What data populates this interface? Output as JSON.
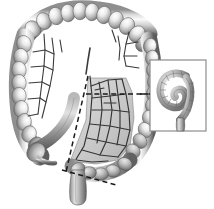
{
  "figure": {
    "style": "grayscale medical illustration",
    "background_color": "#ffffff",
    "width": 214,
    "height": 209
  },
  "palette": {
    "outline": "#2f2f2f",
    "bowel_light": "#f2f2f2",
    "bowel_mid": "#b8b8b8",
    "bowel_dark": "#6e6e6e",
    "bowel_shadow": "#4a4a4a",
    "mesentery_fill": "#c9c9c9",
    "mesentery_fill_light": "#d8d8d8",
    "vessel": "#3a3a3a",
    "dash_line": "#1a1a1a",
    "inset_border": "#8c8c8c",
    "inset_background": "#ffffff"
  },
  "structures": {
    "transverse_colon": {
      "name": "Transverse colon",
      "haustra_count": 11,
      "location": "top"
    },
    "ascending_colon": {
      "name": "Ascending colon",
      "haustra_count": 9,
      "location": "left"
    },
    "descending_colon": {
      "name": "Descending colon",
      "haustra_count": 10,
      "location": "right"
    },
    "hepatic_flexure": {
      "name": "Hepatic flexure",
      "location": "upper-left"
    },
    "splenic_flexure": {
      "name": "Splenic flexure",
      "location": "upper-right"
    },
    "cecum": {
      "name": "Cecum",
      "location": "lower-left"
    },
    "terminal_ileum": {
      "name": "Terminal ileum",
      "location": "lower-left-center"
    },
    "appendix": {
      "name": "Appendix",
      "location": "lower-left"
    },
    "sigmoid_colon": {
      "name": "Sigmoid colon",
      "location": "bottom-center"
    },
    "rectum": {
      "name": "Rectum",
      "location": "bottom-center"
    },
    "mesentery": {
      "name": "Mesentery with vascular arcade",
      "shaded": true,
      "location": "center-right"
    }
  },
  "resection": {
    "proximal_cut_line": {
      "name": "Proximal resection line",
      "style": "dashed",
      "orientation": "horizontal",
      "position": "mid descending colon"
    },
    "distal_cut_line": {
      "name": "Distal resection line",
      "style": "dashed",
      "orientation": "oblique",
      "position": "rectosigmoid junction"
    },
    "mesenteric_cut_line": {
      "name": "Mesenteric division line",
      "style": "dashed",
      "orientation": "oblique",
      "position": "mesentery border"
    },
    "leader_line": {
      "name": "Inset leader line",
      "style": "dashed",
      "orientation": "horizontal"
    }
  },
  "inset": {
    "name": "Resected specimen detail",
    "border_color": "#8c8c8c",
    "x": 150,
    "y": 60,
    "width": 56,
    "height": 71,
    "content": "Coiled resected colon segment with mesentery"
  },
  "vessels": {
    "name": "Mesenteric arterial arcades",
    "branch_count": 14
  }
}
